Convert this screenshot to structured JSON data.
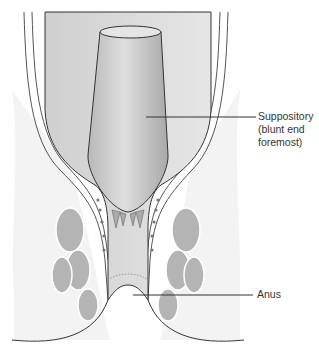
{
  "figure": {
    "labels": [
      {
        "id": "suppository",
        "lines": [
          "Suppository",
          "(blunt end",
          "foremost)"
        ]
      },
      {
        "id": "anus",
        "lines": [
          "Anus"
        ]
      }
    ],
    "colors": {
      "background": "#ffffff",
      "outline": "#333333",
      "tissue": "#d6d6d6",
      "muscle": "#b4b4b4",
      "suppository": "#c4c4c4",
      "leader": "#333333"
    }
  }
}
